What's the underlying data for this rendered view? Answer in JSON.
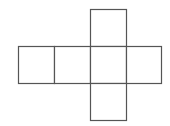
{
  "diagram": {
    "type": "cube-net",
    "stroke_color": "#555555",
    "fill_color": "#ffffff",
    "faces": [
      {
        "id": "top",
        "x": 90,
        "y": 9,
        "w": 36,
        "h": 37
      },
      {
        "id": "left-1",
        "x": 18,
        "y": 46,
        "w": 36,
        "h": 37
      },
      {
        "id": "left-2",
        "x": 54,
        "y": 46,
        "w": 36,
        "h": 37
      },
      {
        "id": "center",
        "x": 90,
        "y": 46,
        "w": 36,
        "h": 37
      },
      {
        "id": "right",
        "x": 126,
        "y": 46,
        "w": 35,
        "h": 37
      },
      {
        "id": "bottom",
        "x": 90,
        "y": 83,
        "w": 36,
        "h": 37
      }
    ]
  }
}
